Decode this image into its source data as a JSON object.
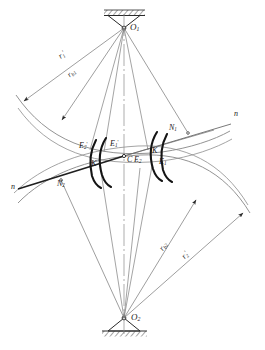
{
  "figure": {
    "type": "engineering-line-diagram",
    "background_color": "#ffffff",
    "line_color": "#5a5a5a",
    "bold_line_color": "#1a1a1a",
    "text_color": "#1a1a1a"
  },
  "labels": {
    "center_top": "O",
    "center_top_sub": "1",
    "center_bottom": "O",
    "center_bottom_sub": "2",
    "radius_1_prime": "r",
    "radius_1_prime_sub": "1",
    "radius_1_prime_sup": "'",
    "radius_base_1": "r",
    "radius_base_1_sub": "b1",
    "radius_2_prime": "r",
    "radius_2_prime_sub": "2",
    "radius_2_prime_sup": "'",
    "radius_base_2": "r",
    "radius_base_2_sub": "b2",
    "node_n1": "N",
    "node_n1_sub": "1",
    "node_n2": "N",
    "node_n2_sub": "2",
    "line_n_right": "n",
    "line_n_left": "n",
    "pitch_point": "C",
    "point_e1": "E",
    "point_e1_sub": "1",
    "point_e2": "E",
    "point_e2_sub": "2",
    "point_e1_prime": "E",
    "point_e1_prime_sub": "1",
    "point_e1_prime_sup": "'",
    "point_e2_prime": "E",
    "point_e2_prime_sub": "2",
    "point_e2_prime_sup": "'",
    "point_k": "K",
    "point_k_prime": "K",
    "point_k_prime_sup": "'"
  },
  "geometry": {
    "pivot_top": {
      "x": 124,
      "y": 28,
      "name": "O1"
    },
    "pivot_bottom": {
      "x": 124,
      "y": 318,
      "name": "O2"
    },
    "pitch_point": {
      "x": 124,
      "y": 156
    },
    "node_n1": {
      "x": 188,
      "y": 133
    },
    "node_n2": {
      "x": 61,
      "y": 180
    },
    "pressure_line_left_end": {
      "x": 18,
      "y": 189
    },
    "pressure_line_right_end": {
      "x": 231,
      "y": 124
    },
    "centerline_top": 14,
    "centerline_bottom": 334
  }
}
